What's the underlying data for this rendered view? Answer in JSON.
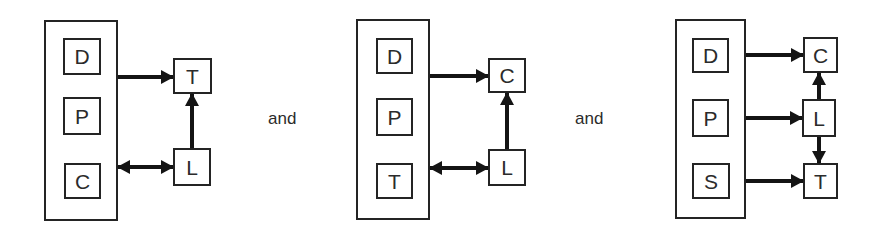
{
  "figure": {
    "separators": [
      "and",
      "and"
    ],
    "colors": {
      "line": "#141414",
      "box_border": "#242424",
      "text": "#2b2b2b",
      "background": "#ffffff"
    },
    "groups": [
      {
        "name": "left-diagram",
        "container_boxes": [
          "D",
          "P",
          "C"
        ],
        "satellite_boxes": [
          "T",
          "L"
        ],
        "connections": [
          {
            "from": "container",
            "to": "T",
            "type": "single",
            "direction": "right"
          },
          {
            "from": "L",
            "to": "T",
            "type": "single",
            "direction": "up"
          },
          {
            "from": "container",
            "to": "L",
            "type": "double",
            "direction": "horizontal"
          }
        ]
      },
      {
        "name": "middle-diagram",
        "container_boxes": [
          "D",
          "P",
          "T"
        ],
        "satellite_boxes": [
          "C",
          "L"
        ],
        "connections": [
          {
            "from": "container",
            "to": "C",
            "type": "single",
            "direction": "right"
          },
          {
            "from": "L",
            "to": "C",
            "type": "single",
            "direction": "up"
          },
          {
            "from": "container",
            "to": "L",
            "type": "double",
            "direction": "horizontal"
          }
        ]
      },
      {
        "name": "right-diagram",
        "container_boxes": [
          "D",
          "P",
          "S"
        ],
        "satellite_boxes": [
          "C",
          "L",
          "T"
        ],
        "connections": [
          {
            "from": "D",
            "to": "C",
            "type": "single",
            "direction": "right"
          },
          {
            "from": "P",
            "to": "L",
            "type": "single",
            "direction": "right"
          },
          {
            "from": "S",
            "to": "T",
            "type": "single",
            "direction": "right"
          },
          {
            "from": "L",
            "to": "C",
            "type": "single",
            "direction": "up"
          },
          {
            "from": "L",
            "to": "T",
            "type": "single",
            "direction": "down"
          }
        ]
      }
    ]
  }
}
